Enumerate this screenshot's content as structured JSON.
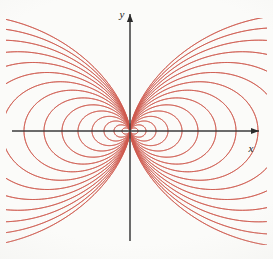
{
  "figure": {
    "background_color": "#fbfbf9",
    "curve_color": "#cf5a4e",
    "axis_color": "#3b3b3b",
    "axis_label_color": "#1a1a1a"
  },
  "axes": {
    "x_label": "x",
    "y_label": "y",
    "origin": {
      "x": 130,
      "y": 131
    },
    "x_start": {
      "x": 12,
      "y": 131
    },
    "x_end": {
      "x": 259,
      "y": 131
    },
    "y_start": {
      "x": 130,
      "y": 241
    },
    "y_end": {
      "x": 130,
      "y": 14
    },
    "x_arrowhead": true,
    "y_arrowhead": true,
    "x_arrowhead_at_left": false,
    "y_arrowhead_at_bottom": false
  },
  "chart_data": {
    "type": "line",
    "xlabel": "x",
    "ylabel": "y",
    "grid": false,
    "legend": null,
    "equation": "r = a*sin^2(theta)",
    "family_parameter": "a",
    "a_values": [
      8,
      16,
      26,
      38,
      52,
      68,
      86,
      106,
      128,
      152,
      178,
      206,
      236,
      268,
      302
    ],
    "mirrored_in_x": true,
    "mirrored_in_y": true,
    "clip_box": {
      "x0": 6,
      "y0": 18,
      "x1": 267,
      "y1": 245
    },
    "scale_px_per_unit": 1,
    "xlim": [
      -124,
      129
    ],
    "ylim": [
      -114,
      113
    ],
    "series": [
      {
        "name": "dipole-lobe-upper",
        "a": 8
      },
      {
        "name": "dipole-lobe-upper",
        "a": 16
      },
      {
        "name": "dipole-lobe-upper",
        "a": 26
      },
      {
        "name": "dipole-lobe-upper",
        "a": 38
      },
      {
        "name": "dipole-lobe-upper",
        "a": 52
      },
      {
        "name": "dipole-lobe-upper",
        "a": 68
      },
      {
        "name": "dipole-lobe-upper",
        "a": 86
      },
      {
        "name": "dipole-lobe-upper",
        "a": 106
      },
      {
        "name": "dipole-lobe-upper",
        "a": 128
      },
      {
        "name": "dipole-lobe-upper",
        "a": 152
      },
      {
        "name": "dipole-lobe-upper",
        "a": 178
      },
      {
        "name": "dipole-lobe-upper",
        "a": 206
      },
      {
        "name": "dipole-lobe-upper",
        "a": 236
      },
      {
        "name": "dipole-lobe-upper",
        "a": 268
      },
      {
        "name": "dipole-lobe-upper",
        "a": 302
      }
    ]
  }
}
